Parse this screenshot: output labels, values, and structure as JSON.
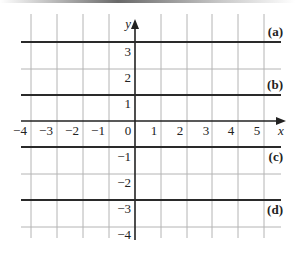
{
  "diagram": {
    "type": "coordinate-grid",
    "axes": {
      "x_label": "x",
      "y_label": "y",
      "x_ticks": [
        "-4",
        "-3",
        "-2",
        "-1",
        "0",
        "1",
        "2",
        "3",
        "4",
        "5"
      ],
      "y_ticks": [
        "3",
        "2",
        "1",
        "-1",
        "-2",
        "-3",
        "-4"
      ],
      "x_range": [
        -4,
        5
      ],
      "y_range": [
        -4,
        4
      ]
    },
    "lines": [
      {
        "label": "(a)",
        "y": 3.5
      },
      {
        "label": "(b)",
        "y": 1.5
      },
      {
        "label": "(c)",
        "y": -1
      },
      {
        "label": "(d)",
        "y": -3
      }
    ],
    "colors": {
      "grid": "#b0b0b0",
      "line": "#222222",
      "axis": "#222222"
    }
  }
}
